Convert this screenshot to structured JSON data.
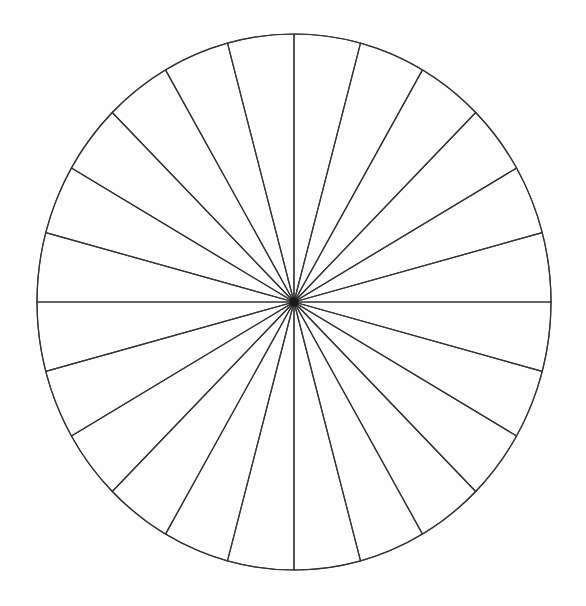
{
  "canvas": {
    "width": 586,
    "height": 606,
    "background_color": "#fefefe"
  },
  "figure": {
    "name": "fraction-circle",
    "kind": "sectored-circle",
    "center_x": 294,
    "center_y": 302,
    "radius_x": 257,
    "radius_y": 268,
    "sector_count": 24,
    "sector_angle_degrees": 15,
    "start_angle_degrees": -90,
    "stroke_color": "#333333",
    "stroke_width": 1.2,
    "fill_color": "#ffffff",
    "hub_color": "#1a1a1a",
    "hub_radius": 4.5
  },
  "chart_data": {
    "type": "pie",
    "title": "",
    "subtitle": "",
    "xlabel": "",
    "ylabel": "",
    "legend": [],
    "annotations": [],
    "grid": false,
    "categories": [
      "1/24",
      "2/24",
      "3/24",
      "4/24",
      "5/24",
      "6/24",
      "7/24",
      "8/24",
      "9/24",
      "10/24",
      "11/24",
      "12/24",
      "13/24",
      "14/24",
      "15/24",
      "16/24",
      "17/24",
      "18/24",
      "19/24",
      "20/24",
      "21/24",
      "22/24",
      "23/24",
      "24/24"
    ],
    "values": [
      15,
      15,
      15,
      15,
      15,
      15,
      15,
      15,
      15,
      15,
      15,
      15,
      15,
      15,
      15,
      15,
      15,
      15,
      15,
      15,
      15,
      15,
      15,
      15
    ],
    "value_unit": "degrees",
    "total_degrees": 360,
    "slice_fraction": "1/24",
    "slice_percent": 4.1667,
    "all_slices_equal": true,
    "slices_filled": 0,
    "slices_empty": 24
  }
}
